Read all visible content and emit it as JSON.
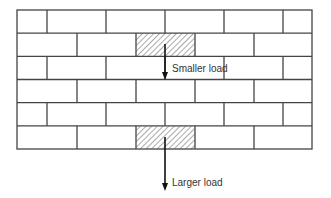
{
  "diagram": {
    "type": "brick-wall-load-illustration",
    "wall": {
      "x": 17,
      "y": 10,
      "width": 295,
      "height": 139,
      "rows": 6,
      "row_height": 23.17,
      "odd_row_joints": [
        47,
        106,
        165,
        224,
        283
      ],
      "even_row_joints": [
        77,
        136,
        195,
        254
      ]
    },
    "loaded_bricks": [
      {
        "id": "upper",
        "row": 2,
        "x": 136,
        "width": 59
      },
      {
        "id": "lower",
        "row": 6,
        "x": 136,
        "width": 59
      }
    ],
    "loads": [
      {
        "id": "smaller",
        "label": "Smaller load",
        "x": 165,
        "y_start": 44,
        "y_end": 80,
        "label_x": 172,
        "label_y": 72
      },
      {
        "id": "larger",
        "label": "Larger load",
        "x": 165,
        "y_start": 137,
        "y_end": 191,
        "label_x": 172,
        "label_y": 186
      }
    ],
    "colors": {
      "line": "#444444",
      "arrow": "#111111",
      "hatch": "#555555",
      "text": "#333333"
    }
  }
}
